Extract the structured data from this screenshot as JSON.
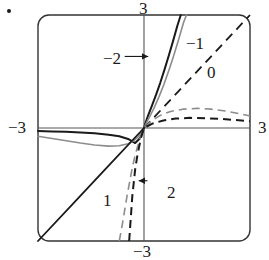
{
  "figure": {
    "bullet_marker": "•"
  },
  "axes": {
    "x_left_label": "−3",
    "x_right_label": "3",
    "y_top_label": "3",
    "y_bottom_label": "−3",
    "axis_color": "#555555",
    "frame_color": "#333333"
  },
  "curve_labels": [
    {
      "text": "−2",
      "has_arrow": true,
      "arrow_dir": "right"
    },
    {
      "text": "−1",
      "has_arrow": false,
      "arrow_dir": ""
    },
    {
      "text": "0",
      "has_arrow": false,
      "arrow_dir": ""
    },
    {
      "text": "1",
      "has_arrow": false,
      "arrow_dir": ""
    },
    {
      "text": "2",
      "has_arrow": true,
      "arrow_dir": "left"
    }
  ],
  "chart_data": {
    "type": "line",
    "title": "",
    "xlabel": "",
    "ylabel": "",
    "xlim": [
      -3,
      3
    ],
    "ylim": [
      -3,
      3
    ],
    "xticks": [
      -3,
      3
    ],
    "yticks": [
      -3,
      3
    ],
    "xtick_labels": [
      "−3",
      "3"
    ],
    "ytick_labels": [
      "−3",
      "3"
    ],
    "grid": false,
    "legend": "inline-annotations",
    "annotations": [
      {
        "label": "−2",
        "x": -1.0,
        "y": 1.9,
        "arrow_to_x": 0.12,
        "arrow_to_y": 1.9
      },
      {
        "label": "−1",
        "x": 0.95,
        "y": 2.3,
        "arrow_to_x": null,
        "arrow_to_y": null
      },
      {
        "label": "0",
        "x": 1.55,
        "y": 1.45,
        "arrow_to_x": null,
        "arrow_to_y": null
      },
      {
        "label": "1",
        "x": -0.6,
        "y": -1.7,
        "arrow_to_x": null,
        "arrow_to_y": null
      },
      {
        "label": "2",
        "x": 0.55,
        "y": -1.4,
        "arrow_to_x": -0.15,
        "arrow_to_y": -1.4
      }
    ],
    "series": [
      {
        "name": "−2",
        "color": "#1a1a1a",
        "style": "solid",
        "width": 2.0,
        "points": [
          [
            -3.0,
            -0.08
          ],
          [
            -2.6,
            -0.09
          ],
          [
            -2.2,
            -0.1
          ],
          [
            -1.8,
            -0.12
          ],
          [
            -1.4,
            -0.14
          ],
          [
            -1.0,
            -0.18
          ],
          [
            -0.7,
            -0.22
          ],
          [
            -0.45,
            -0.29
          ],
          [
            -0.25,
            -0.4
          ],
          [
            -0.12,
            -0.28
          ],
          [
            -0.05,
            -0.14
          ],
          [
            0.0,
            0.0
          ],
          [
            0.05,
            0.16
          ],
          [
            0.12,
            0.34
          ],
          [
            0.22,
            0.58
          ],
          [
            0.34,
            0.88
          ],
          [
            0.46,
            1.2
          ],
          [
            0.58,
            1.55
          ],
          [
            0.7,
            1.92
          ],
          [
            0.82,
            2.3
          ],
          [
            0.94,
            2.7
          ],
          [
            1.04,
            3.0
          ]
        ]
      },
      {
        "name": "−1",
        "color": "#8c8c8c",
        "style": "solid",
        "width": 1.6,
        "points": [
          [
            -3.0,
            -0.22
          ],
          [
            -2.6,
            -0.28
          ],
          [
            -2.2,
            -0.34
          ],
          [
            -1.8,
            -0.4
          ],
          [
            -1.4,
            -0.45
          ],
          [
            -1.0,
            -0.48
          ],
          [
            -0.7,
            -0.47
          ],
          [
            -0.45,
            -0.42
          ],
          [
            -0.28,
            -0.33
          ],
          [
            -0.15,
            -0.22
          ],
          [
            -0.06,
            -0.1
          ],
          [
            0.0,
            0.0
          ],
          [
            0.06,
            0.12
          ],
          [
            0.15,
            0.28
          ],
          [
            0.28,
            0.52
          ],
          [
            0.42,
            0.82
          ],
          [
            0.56,
            1.15
          ],
          [
            0.7,
            1.52
          ],
          [
            0.84,
            1.92
          ],
          [
            0.98,
            2.35
          ],
          [
            1.12,
            2.8
          ],
          [
            1.2,
            3.0
          ]
        ]
      },
      {
        "name": "0",
        "color": "#1a1a1a",
        "style": "mixed-dashed-positive",
        "width": 1.8,
        "points": [
          [
            -3.0,
            -3.0
          ],
          [
            -2.0,
            -2.0
          ],
          [
            -1.0,
            -1.0
          ],
          [
            0.0,
            0.0
          ],
          [
            1.0,
            1.0
          ],
          [
            2.0,
            2.0
          ],
          [
            3.0,
            3.0
          ]
        ]
      },
      {
        "name": "1",
        "color": "#8c8c8c",
        "style": "dashed",
        "width": 1.6,
        "points": [
          [
            -0.7,
            -3.0
          ],
          [
            -0.62,
            -2.6
          ],
          [
            -0.55,
            -2.2
          ],
          [
            -0.48,
            -1.8
          ],
          [
            -0.41,
            -1.45
          ],
          [
            -0.34,
            -1.1
          ],
          [
            -0.27,
            -0.8
          ],
          [
            -0.2,
            -0.55
          ],
          [
            -0.13,
            -0.33
          ],
          [
            -0.06,
            -0.14
          ],
          [
            0.0,
            0.0
          ],
          [
            0.2,
            0.18
          ],
          [
            0.45,
            0.33
          ],
          [
            0.75,
            0.44
          ],
          [
            1.1,
            0.5
          ],
          [
            1.5,
            0.52
          ],
          [
            1.9,
            0.5
          ],
          [
            2.3,
            0.45
          ],
          [
            2.7,
            0.38
          ],
          [
            3.0,
            0.32
          ]
        ]
      },
      {
        "name": "2",
        "color": "#1a1a1a",
        "style": "dashed",
        "width": 2.0,
        "points": [
          [
            -0.42,
            -3.0
          ],
          [
            -0.39,
            -2.6
          ],
          [
            -0.36,
            -2.2
          ],
          [
            -0.33,
            -1.8
          ],
          [
            -0.29,
            -1.45
          ],
          [
            -0.25,
            -1.1
          ],
          [
            -0.2,
            -0.8
          ],
          [
            -0.15,
            -0.55
          ],
          [
            -0.1,
            -0.33
          ],
          [
            -0.05,
            -0.14
          ],
          [
            0.0,
            0.0
          ],
          [
            0.25,
            0.12
          ],
          [
            0.55,
            0.2
          ],
          [
            0.9,
            0.25
          ],
          [
            1.3,
            0.27
          ],
          [
            1.75,
            0.26
          ],
          [
            2.2,
            0.24
          ],
          [
            2.6,
            0.21
          ],
          [
            3.0,
            0.18
          ]
        ]
      }
    ]
  }
}
